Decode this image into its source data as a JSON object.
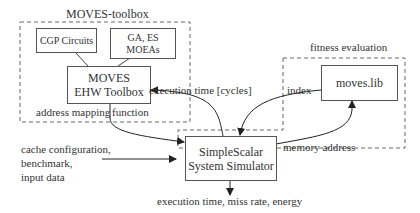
{
  "groups": {
    "toolbox_title": "MOVES-toolbox",
    "fitness_title": "fitness evaluation"
  },
  "boxes": {
    "cgp": "CGP Circuits",
    "ga_line1": "GA, ES",
    "ga_line2": "MOEAs",
    "ehw_line1": "MOVES",
    "ehw_line2": "EHW Toolbox",
    "moveslib": "moves.lib",
    "sim_line1": "SimpleScalar",
    "sim_line2": "System Simulator"
  },
  "edge_labels": {
    "execution_time": "execution time [cycles]",
    "index": "index",
    "address_mapping": "address mapping",
    "function": "function",
    "memory_address": "memory address",
    "inputs_line1": "cache configuration,",
    "inputs_line2": "benchmark,",
    "inputs_line3": "input data",
    "outputs": "execution time, miss rate, energy"
  }
}
